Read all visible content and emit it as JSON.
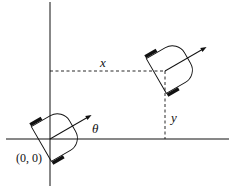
{
  "diagram": {
    "labels": {
      "origin": "(0, 0)",
      "x": "x",
      "y": "y",
      "theta": "θ"
    },
    "colors": {
      "line": "#111111",
      "wheel": "#111111",
      "background": "#ffffff"
    }
  }
}
